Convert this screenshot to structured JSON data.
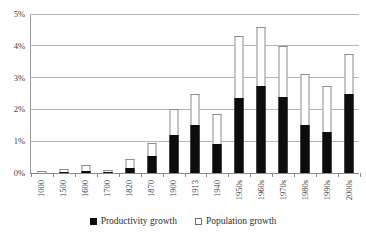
{
  "chart_data": {
    "type": "bar",
    "subtype": "stacked-bar",
    "title": "",
    "xlabel": "",
    "ylabel": "",
    "ylim": [
      0,
      5
    ],
    "y_unit": "%",
    "ytick_labels": [
      "0%",
      "1%",
      "2%",
      "3%",
      "4%",
      "5%"
    ],
    "ytick_values": [
      0,
      1,
      2,
      3,
      4,
      5
    ],
    "grid": true,
    "grid_axis": "y",
    "legend_position": "bottom",
    "categories": [
      "1000",
      "1500",
      "1600",
      "1700",
      "1820",
      "1870",
      "1900",
      "1913",
      "1940",
      "1950s",
      "1960s",
      "1970s",
      "1980s",
      "1990s",
      "2000s"
    ],
    "series": [
      {
        "name": "Productivity growth",
        "color": "#0d0d0d",
        "values": [
          0.0,
          0.03,
          0.05,
          0.03,
          0.15,
          0.55,
          1.2,
          1.5,
          0.9,
          2.35,
          2.75,
          2.4,
          1.5,
          1.3,
          2.5
        ]
      },
      {
        "name": "Population growth",
        "color": "#ffffff",
        "values": [
          0.05,
          0.09,
          0.2,
          0.07,
          0.3,
          0.4,
          0.8,
          1.0,
          0.95,
          1.95,
          1.85,
          1.6,
          1.6,
          1.45,
          1.25
        ]
      }
    ],
    "totals": [
      0.05,
      0.12,
      0.25,
      0.1,
      0.45,
      0.95,
      2.0,
      2.5,
      1.85,
      4.3,
      4.6,
      4.0,
      3.1,
      2.75,
      3.75
    ]
  },
  "legend": {
    "items": [
      {
        "label": "Productivity growth",
        "marker": "filled-square-icon"
      },
      {
        "label": "Population growth",
        "marker": "open-square-icon"
      }
    ]
  }
}
